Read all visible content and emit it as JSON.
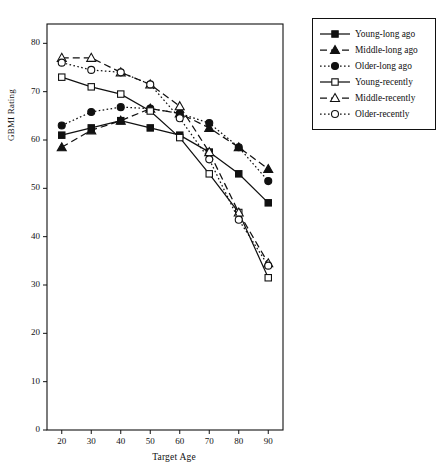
{
  "chart_data": {
    "type": "line",
    "title": "",
    "xlabel": "Target Age",
    "ylabel": "GBMI Rating",
    "x": [
      20,
      30,
      40,
      50,
      60,
      70,
      80,
      90
    ],
    "xlim": [
      15,
      95
    ],
    "ylim": [
      0,
      84
    ],
    "xticks": [
      20,
      30,
      40,
      50,
      60,
      70,
      80,
      90
    ],
    "yticks": [
      0,
      10,
      20,
      30,
      40,
      50,
      60,
      70,
      80
    ],
    "grid": false,
    "legend_position": "right-outside",
    "series": [
      {
        "name": "Young-long ago",
        "marker": "filled-square",
        "line": "solid",
        "values": [
          61,
          62.5,
          64,
          62.5,
          61,
          57.5,
          53,
          47
        ]
      },
      {
        "name": "Middle-long ago",
        "marker": "filled-triangle",
        "line": "dashed",
        "values": [
          58.5,
          62,
          64,
          66.5,
          65.5,
          62.5,
          58.5,
          54
        ]
      },
      {
        "name": "Older-long ago",
        "marker": "filled-circle",
        "line": "dotted",
        "values": [
          63,
          65.8,
          66.8,
          66.5,
          65.5,
          63.5,
          58.5,
          51.5
        ]
      },
      {
        "name": "Young-recently",
        "marker": "open-square",
        "line": "solid",
        "values": [
          73,
          71,
          69.5,
          66,
          60.5,
          53,
          45,
          31.5
        ]
      },
      {
        "name": "Middle-recently",
        "marker": "open-triangle",
        "line": "dashed",
        "values": [
          77,
          77,
          74,
          71.5,
          67,
          57.5,
          45,
          34.5
        ]
      },
      {
        "name": "Older-recently",
        "marker": "open-circle",
        "line": "dotted",
        "values": [
          76,
          74.5,
          74,
          71.5,
          64.5,
          56,
          43.5,
          34
        ]
      }
    ]
  },
  "legend": {
    "items": [
      {
        "label": "Young-long ago"
      },
      {
        "label": "Middle-long ago"
      },
      {
        "label": "Older-long ago"
      },
      {
        "label": "Young-recently"
      },
      {
        "label": "Middle-recently"
      },
      {
        "label": "Older-recently"
      }
    ]
  },
  "axes": {
    "y_title": "GBMI Rating",
    "x_title": "Target Age",
    "y_tick_labels": [
      "0",
      "10",
      "20",
      "30",
      "40",
      "50",
      "60",
      "70",
      "80"
    ],
    "x_tick_labels": [
      "20",
      "30",
      "40",
      "50",
      "60",
      "70",
      "80",
      "90"
    ]
  },
  "colors": {
    "ink": "#111111",
    "background": "#ffffff"
  }
}
